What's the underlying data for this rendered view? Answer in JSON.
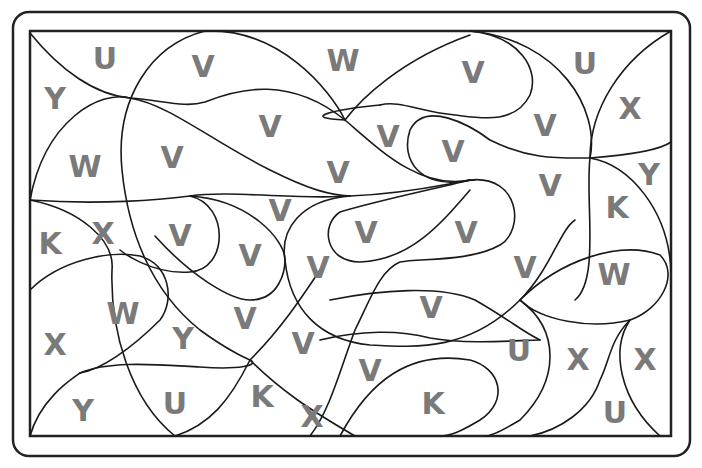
{
  "puzzle": {
    "type": "color-by-letter",
    "colors": {
      "line": "#1a1a1a",
      "letter": "#7a7a7a",
      "background": "#ffffff"
    },
    "regions": [
      {
        "letter": "U",
        "x": 105,
        "y": 58
      },
      {
        "letter": "V",
        "x": 203,
        "y": 66
      },
      {
        "letter": "W",
        "x": 343,
        "y": 60
      },
      {
        "letter": "V",
        "x": 473,
        "y": 72
      },
      {
        "letter": "U",
        "x": 585,
        "y": 63
      },
      {
        "letter": "Y",
        "x": 55,
        "y": 98
      },
      {
        "letter": "X",
        "x": 630,
        "y": 108
      },
      {
        "letter": "V",
        "x": 270,
        "y": 126
      },
      {
        "letter": "V",
        "x": 388,
        "y": 136
      },
      {
        "letter": "V",
        "x": 545,
        "y": 125
      },
      {
        "letter": "W",
        "x": 85,
        "y": 166
      },
      {
        "letter": "V",
        "x": 172,
        "y": 157
      },
      {
        "letter": "V",
        "x": 453,
        "y": 151
      },
      {
        "letter": "V",
        "x": 338,
        "y": 172
      },
      {
        "letter": "Y",
        "x": 649,
        "y": 174
      },
      {
        "letter": "V",
        "x": 550,
        "y": 185
      },
      {
        "letter": "K",
        "x": 617,
        "y": 207
      },
      {
        "letter": "V",
        "x": 280,
        "y": 210
      },
      {
        "letter": "X",
        "x": 103,
        "y": 233
      },
      {
        "letter": "V",
        "x": 180,
        "y": 235
      },
      {
        "letter": "K",
        "x": 50,
        "y": 243
      },
      {
        "letter": "V",
        "x": 366,
        "y": 232
      },
      {
        "letter": "V",
        "x": 466,
        "y": 232
      },
      {
        "letter": "V",
        "x": 250,
        "y": 255
      },
      {
        "letter": "V",
        "x": 318,
        "y": 267
      },
      {
        "letter": "V",
        "x": 525,
        "y": 267
      },
      {
        "letter": "W",
        "x": 614,
        "y": 274
      },
      {
        "letter": "W",
        "x": 123,
        "y": 313
      },
      {
        "letter": "V",
        "x": 431,
        "y": 307
      },
      {
        "letter": "V",
        "x": 245,
        "y": 318
      },
      {
        "letter": "Y",
        "x": 183,
        "y": 338
      },
      {
        "letter": "V",
        "x": 303,
        "y": 343
      },
      {
        "letter": "X",
        "x": 55,
        "y": 344
      },
      {
        "letter": "U",
        "x": 519,
        "y": 350
      },
      {
        "letter": "X",
        "x": 578,
        "y": 359
      },
      {
        "letter": "X",
        "x": 645,
        "y": 359
      },
      {
        "letter": "V",
        "x": 370,
        "y": 370
      },
      {
        "letter": "K",
        "x": 262,
        "y": 396
      },
      {
        "letter": "K",
        "x": 433,
        "y": 403
      },
      {
        "letter": "U",
        "x": 175,
        "y": 403
      },
      {
        "letter": "Y",
        "x": 83,
        "y": 410
      },
      {
        "letter": "X",
        "x": 312,
        "y": 416
      },
      {
        "letter": "U",
        "x": 615,
        "y": 412
      }
    ]
  }
}
